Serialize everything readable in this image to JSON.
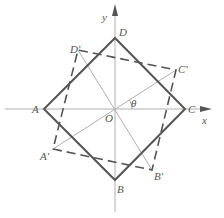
{
  "diagram": {
    "axes": {
      "x_label": "x",
      "y_label": "y",
      "origin_label": "O",
      "angle_label": "θ"
    },
    "square_solid": {
      "vertices": [
        {
          "name": "A",
          "label": "A"
        },
        {
          "name": "B",
          "label": "B"
        },
        {
          "name": "C",
          "label": "C"
        },
        {
          "name": "D",
          "label": "D"
        }
      ]
    },
    "square_dashed": {
      "vertices": [
        {
          "name": "A'",
          "label": "A'"
        },
        {
          "name": "B'",
          "label": "B'"
        },
        {
          "name": "C'",
          "label": "C'"
        },
        {
          "name": "D'",
          "label": "D'"
        }
      ]
    },
    "colors": {
      "solid_square": "#555555",
      "dashed_square": "#555555",
      "axes": "#aaaaaa",
      "diagonals": "#aaaaaa"
    }
  }
}
